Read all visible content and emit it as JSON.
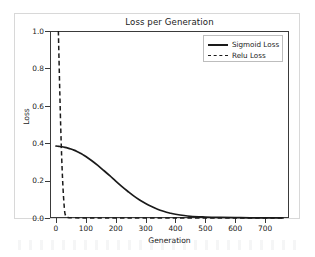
{
  "figure": {
    "background_color": "#ffffff",
    "frame_color": "#d8d8d8",
    "axis_color": "#3a3a3a"
  },
  "chart_data": {
    "type": "line",
    "title": "Loss per Generation",
    "xlabel": "Generation",
    "ylabel": "Loss",
    "xlim": [
      -20,
      780
    ],
    "ylim": [
      0.0,
      1.0
    ],
    "grid": false,
    "legend_position": "upper right",
    "xticks": [
      0,
      100,
      200,
      300,
      400,
      500,
      600,
      700
    ],
    "xtick_labels": [
      "0",
      "100",
      "200",
      "300",
      "400",
      "500",
      "600",
      "700"
    ],
    "yticks": [
      0.0,
      0.2,
      0.4,
      0.6,
      0.8,
      1.0
    ],
    "ytick_labels": [
      "0.0",
      "0.2",
      "0.4",
      "0.6",
      "0.8",
      "1.0"
    ],
    "series": [
      {
        "name": "Sigmoid Loss",
        "style": "solid",
        "color": "#1a1a1a",
        "x": [
          0,
          10,
          20,
          30,
          40,
          50,
          60,
          70,
          80,
          90,
          100,
          120,
          140,
          160,
          180,
          200,
          220,
          240,
          260,
          280,
          300,
          320,
          340,
          360,
          380,
          400,
          450,
          500,
          550,
          600,
          650,
          700,
          760
        ],
        "values": [
          0.385,
          0.383,
          0.381,
          0.378,
          0.374,
          0.369,
          0.363,
          0.356,
          0.348,
          0.339,
          0.329,
          0.306,
          0.281,
          0.254,
          0.226,
          0.197,
          0.169,
          0.143,
          0.118,
          0.096,
          0.077,
          0.061,
          0.047,
          0.036,
          0.027,
          0.02,
          0.009,
          0.005,
          0.003,
          0.002,
          0.001,
          0.001,
          0.0
        ]
      },
      {
        "name": "Relu Loss",
        "style": "dashed",
        "color": "#1a1a1a",
        "x": [
          8,
          10,
          13,
          16,
          19,
          22,
          25,
          28,
          31,
          40,
          60,
          100,
          200,
          400,
          600,
          760
        ],
        "values": [
          1.0,
          0.86,
          0.66,
          0.48,
          0.33,
          0.21,
          0.12,
          0.055,
          0.018,
          0.003,
          0.001,
          0.0,
          0.0,
          0.0,
          0.0,
          0.0
        ]
      }
    ]
  }
}
